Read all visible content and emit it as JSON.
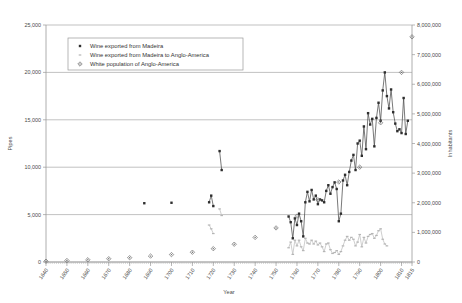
{
  "chart_data": {
    "type": "line",
    "title": "",
    "xlabel": "Year",
    "ylabel": "Pipes",
    "y2label": "Inhabitants",
    "xlim": [
      1640,
      1815
    ],
    "ylim": [
      0,
      25000
    ],
    "y2lim": [
      0,
      8000000
    ],
    "grid": "horizontal",
    "legend_position": "top-left-inside",
    "x_tick_labels": [
      "1640",
      "1650",
      "1660",
      "1670",
      "1680",
      "1690",
      "1700",
      "1710",
      "1720",
      "1730",
      "1740",
      "1750",
      "1760",
      "1770",
      "1780",
      "1790",
      "1800",
      "1810",
      "1815"
    ],
    "x_tick_values": [
      1640,
      1650,
      1660,
      1670,
      1680,
      1690,
      1700,
      1710,
      1720,
      1730,
      1740,
      1750,
      1760,
      1770,
      1780,
      1790,
      1800,
      1810,
      1815
    ],
    "y_tick_labels": [
      "0",
      "5,000",
      "10,000",
      "15,000",
      "20,000",
      "25,000"
    ],
    "y_tick_values": [
      0,
      5000,
      10000,
      15000,
      20000,
      25000
    ],
    "y2_tick_labels": [
      "0",
      "1,000,000",
      "2,000,000",
      "3,000,000",
      "4,000,000",
      "5,000,000",
      "6,000,000",
      "7,000,000",
      "8,000,000"
    ],
    "y2_tick_values": [
      0,
      1000000,
      2000000,
      3000000,
      4000000,
      5000000,
      6000000,
      7000000,
      8000000
    ],
    "series": [
      {
        "name": "Wine exported from Madeira",
        "axis": "left",
        "marker": "square",
        "color": "#2e2e2e",
        "points": [
          [
            1687,
            6200
          ],
          [
            1700,
            6250
          ],
          [
            1718,
            6300
          ],
          [
            1719,
            7000
          ],
          [
            1720,
            5900
          ],
          [
            1723,
            11700
          ],
          [
            1724,
            9700
          ],
          [
            1756,
            4800
          ],
          [
            1757,
            4200
          ],
          [
            1758,
            2500
          ],
          [
            1759,
            4600
          ],
          [
            1760,
            3900
          ],
          [
            1761,
            5100
          ],
          [
            1762,
            4300
          ],
          [
            1763,
            2700
          ],
          [
            1764,
            6300
          ],
          [
            1765,
            7400
          ],
          [
            1766,
            6400
          ],
          [
            1767,
            7600
          ],
          [
            1768,
            6600
          ],
          [
            1769,
            7000
          ],
          [
            1770,
            6100
          ],
          [
            1771,
            6600
          ],
          [
            1772,
            6500
          ],
          [
            1773,
            6300
          ],
          [
            1774,
            7500
          ],
          [
            1775,
            8100
          ],
          [
            1776,
            7200
          ],
          [
            1777,
            7900
          ],
          [
            1778,
            8400
          ],
          [
            1779,
            7700
          ],
          [
            1780,
            4300
          ],
          [
            1781,
            5100
          ],
          [
            1782,
            8600
          ],
          [
            1783,
            9200
          ],
          [
            1784,
            8100
          ],
          [
            1785,
            9500
          ],
          [
            1786,
            10700
          ],
          [
            1787,
            11300
          ],
          [
            1788,
            9700
          ],
          [
            1789,
            12500
          ],
          [
            1790,
            12800
          ],
          [
            1791,
            11200
          ],
          [
            1792,
            14300
          ],
          [
            1793,
            11900
          ],
          [
            1794,
            15700
          ],
          [
            1795,
            14500
          ],
          [
            1796,
            15100
          ],
          [
            1797,
            12200
          ],
          [
            1798,
            15200
          ],
          [
            1799,
            16800
          ],
          [
            1800,
            14900
          ],
          [
            1801,
            18100
          ],
          [
            1802,
            20000
          ],
          [
            1803,
            17500
          ],
          [
            1804,
            16200
          ],
          [
            1805,
            18200
          ],
          [
            1806,
            15800
          ],
          [
            1807,
            14600
          ],
          [
            1808,
            13800
          ],
          [
            1809,
            14000
          ],
          [
            1810,
            13600
          ],
          [
            1811,
            17300
          ],
          [
            1812,
            13500
          ],
          [
            1813,
            14900
          ]
        ]
      },
      {
        "name": "Wine exported from Madeira to Anglo-America",
        "axis": "left",
        "marker": "dash",
        "color": "#b5b5b5",
        "points": [
          [
            1718,
            3900
          ],
          [
            1719,
            3500
          ],
          [
            1720,
            3000
          ],
          [
            1723,
            5600
          ],
          [
            1724,
            4900
          ],
          [
            1756,
            1500
          ],
          [
            1757,
            2100
          ],
          [
            1758,
            800
          ],
          [
            1759,
            2300
          ],
          [
            1760,
            1700
          ],
          [
            1761,
            2300
          ],
          [
            1762,
            1600
          ],
          [
            1763,
            1200
          ],
          [
            1764,
            2500
          ],
          [
            1765,
            2000
          ],
          [
            1766,
            1900
          ],
          [
            1767,
            2300
          ],
          [
            1768,
            1900
          ],
          [
            1769,
            2200
          ],
          [
            1770,
            1800
          ],
          [
            1771,
            2000
          ],
          [
            1772,
            1600
          ],
          [
            1773,
            1100
          ],
          [
            1774,
            1900
          ],
          [
            1775,
            2000
          ],
          [
            1776,
            1300
          ],
          [
            1777,
            900
          ],
          [
            1778,
            1000
          ],
          [
            1779,
            1200
          ],
          [
            1780,
            800
          ],
          [
            1781,
            1100
          ],
          [
            1782,
            1700
          ],
          [
            1783,
            2300
          ],
          [
            1784,
            2700
          ],
          [
            1785,
            2300
          ],
          [
            1786,
            2600
          ],
          [
            1787,
            2400
          ],
          [
            1788,
            1700
          ],
          [
            1789,
            2100
          ],
          [
            1790,
            2900
          ],
          [
            1791,
            1600
          ],
          [
            1792,
            2600
          ],
          [
            1793,
            2000
          ],
          [
            1794,
            2700
          ],
          [
            1795,
            2900
          ],
          [
            1796,
            3000
          ],
          [
            1797,
            2500
          ],
          [
            1798,
            2800
          ],
          [
            1799,
            3300
          ],
          [
            1800,
            3500
          ],
          [
            1801,
            2400
          ],
          [
            1802,
            1900
          ],
          [
            1803,
            1700
          ]
        ]
      },
      {
        "name": "White population of Anglo-America",
        "axis": "right",
        "marker": "diamond",
        "color": "#6b6b6b",
        "points": [
          [
            1640,
            27000
          ],
          [
            1650,
            50000
          ],
          [
            1660,
            75000
          ],
          [
            1670,
            110000
          ],
          [
            1680,
            145000
          ],
          [
            1690,
            200000
          ],
          [
            1700,
            250000
          ],
          [
            1710,
            330000
          ],
          [
            1720,
            450000
          ],
          [
            1730,
            600000
          ],
          [
            1740,
            830000
          ],
          [
            1750,
            1150000
          ],
          [
            1760,
            1550000
          ],
          [
            1770,
            2100000
          ],
          [
            1780,
            2700000
          ],
          [
            1790,
            3200000
          ],
          [
            1800,
            4700000
          ],
          [
            1810,
            6400000
          ],
          [
            1815,
            7600000
          ]
        ]
      }
    ],
    "legend": [
      {
        "label": "Wine exported from Madeira",
        "marker": "square",
        "color": "#2e2e2e"
      },
      {
        "label": "Wine exported from Madeira to Anglo-America",
        "marker": "dash",
        "color": "#b5b5b5"
      },
      {
        "label": "White population of Anglo-America",
        "marker": "diamond",
        "color": "#6b6b6b"
      }
    ]
  }
}
